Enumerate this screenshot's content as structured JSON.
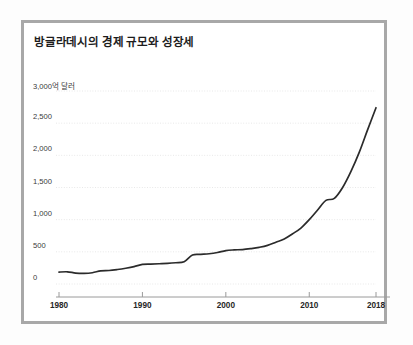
{
  "card": {
    "title": "방글라데시의 경제 규모와 성장세",
    "border_color": "#a8a8a8",
    "background": "#ffffff"
  },
  "chart_data": {
    "type": "line",
    "title": "방글라데시의 경제 규모와 성장세",
    "xlabel": "",
    "ylabel": "3,000억 달러",
    "unit_label": "3,000억 달러",
    "series_color": "#2b2b2b",
    "grid": true,
    "grid_color": "#e8e8e8",
    "legend_position": "none",
    "xlim": [
      1980,
      2018
    ],
    "ylim": [
      0,
      3000
    ],
    "yticks": [
      0,
      500,
      1000,
      1500,
      2000,
      2500,
      3000
    ],
    "ytick_labels": [
      "0",
      "500",
      "1,000",
      "1,500",
      "2,000",
      "2,500",
      "3,000억 달러"
    ],
    "xticks": [
      1980,
      1990,
      2000,
      2010,
      2018
    ],
    "xtick_labels": [
      "1980",
      "1990",
      "2000",
      "2010",
      "2018"
    ],
    "x": [
      1980,
      1981,
      1982,
      1983,
      1984,
      1985,
      1986,
      1987,
      1988,
      1989,
      1990,
      1991,
      1992,
      1993,
      1994,
      1995,
      1996,
      1997,
      1998,
      1999,
      2000,
      2001,
      2002,
      2003,
      2004,
      2005,
      2006,
      2007,
      2008,
      2009,
      2010,
      2011,
      2012,
      2013,
      2014,
      2015,
      2016,
      2017,
      2018
    ],
    "values": [
      185,
      190,
      170,
      165,
      175,
      205,
      210,
      225,
      245,
      270,
      305,
      310,
      315,
      320,
      330,
      345,
      450,
      460,
      470,
      490,
      520,
      530,
      535,
      550,
      570,
      600,
      650,
      700,
      780,
      870,
      1000,
      1150,
      1300,
      1330,
      1500,
      1750,
      2050,
      2400,
      2740
    ],
    "annotations": []
  }
}
